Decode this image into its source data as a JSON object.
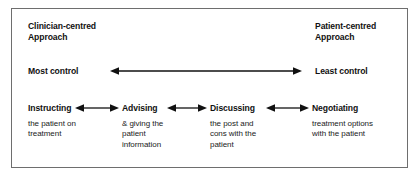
{
  "diagram": {
    "title_left": "Clinician-centred\nApproach",
    "title_right": "Patient-centred\nApproach",
    "control_left": "Most control",
    "control_right": "Least control",
    "continuum_arrow": "double-headed-horizontal-arrow",
    "stages": [
      {
        "label": "Instructing",
        "description": "the patient on\ntreatment"
      },
      {
        "label": "Advising",
        "description": "& giving the\npatient\ninformation"
      },
      {
        "label": "Discussing",
        "description": "the post and\ncons with the\npatient"
      },
      {
        "label": "Negotiating",
        "description": "treatment options\nwith the patient"
      }
    ],
    "colors": {
      "border": "#6e6e6e",
      "ink": "#111111",
      "background": "#ffffff"
    }
  }
}
